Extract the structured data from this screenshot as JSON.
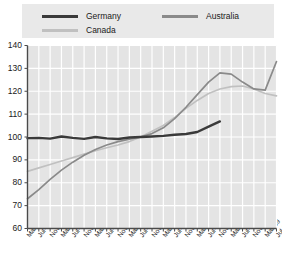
{
  "chart_data": {
    "type": "line",
    "title": "",
    "xlabel": "",
    "ylabel": "",
    "ylim": [
      60,
      140
    ],
    "yticks": [
      60,
      70,
      80,
      90,
      100,
      110,
      120,
      130,
      140
    ],
    "grid": true,
    "legend_position": "top",
    "x": [
      "Mar-02",
      "Jul-02",
      "Nov-02",
      "Mar-03",
      "Jul-03",
      "Nov-03",
      "Mar-04",
      "Jul-04",
      "Nov-04",
      "Mar-05",
      "Jul-05",
      "Nov-05",
      "Mar-06",
      "Jul-06",
      "Nov-06",
      "Mar-07",
      "Jul-07",
      "Nov-07",
      "Mar-08",
      "Jul-08",
      "Nov-08",
      "Mar-09",
      "Jul-09"
    ],
    "series": [
      {
        "name": "Germany",
        "color": "#3a3a3a",
        "values": [
          99.5,
          99.6,
          99.3,
          100.2,
          99.6,
          99.2,
          100.0,
          99.4,
          99.1,
          99.8,
          100.0,
          100.2,
          100.5,
          101.0,
          101.3,
          102.2,
          104.5,
          106.8,
          null,
          null,
          null,
          null,
          null
        ]
      },
      {
        "name": "Canada",
        "color": "#c0c0c0",
        "values": [
          85.0,
          86.5,
          88.0,
          89.5,
          91.0,
          92.5,
          94.0,
          95.3,
          96.5,
          98.0,
          100.0,
          102.5,
          105.0,
          108.5,
          112.5,
          116.0,
          119.0,
          121.0,
          122.0,
          122.3,
          121.0,
          119.0,
          118.0
        ]
      },
      {
        "name": "Australia",
        "color": "#8a8a8a",
        "values": [
          73.0,
          77.0,
          81.5,
          85.5,
          89.0,
          92.0,
          94.5,
          96.5,
          98.0,
          99.0,
          100.0,
          101.5,
          104.0,
          108.0,
          113.0,
          118.5,
          124.0,
          128.0,
          127.5,
          124.0,
          121.0,
          120.5,
          133.0
        ]
      }
    ]
  },
  "legend": {
    "items": [
      {
        "label": "Germany"
      },
      {
        "label": "Canada"
      },
      {
        "label": "Australia"
      }
    ]
  }
}
